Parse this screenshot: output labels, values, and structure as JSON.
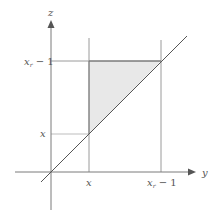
{
  "diagram": {
    "axes": {
      "horizontal_label": "y",
      "vertical_label": "z"
    },
    "ticks": {
      "horizontal": [
        {
          "label_main": "x",
          "label_sub": "",
          "label_tail": ""
        },
        {
          "label_main": "x",
          "label_sub": "r",
          "label_tail": " − 1"
        }
      ],
      "vertical": [
        {
          "label_main": "x",
          "label_sub": "",
          "label_tail": ""
        },
        {
          "label_main": "x",
          "label_sub": "r",
          "label_tail": " − 1"
        }
      ]
    },
    "region": {
      "description": "shaded triangle between z = y, y = x, and z = x_r − 1",
      "fill_color": "#e6e6e6"
    },
    "line_color": "#555555",
    "guide_color": "#999999"
  }
}
